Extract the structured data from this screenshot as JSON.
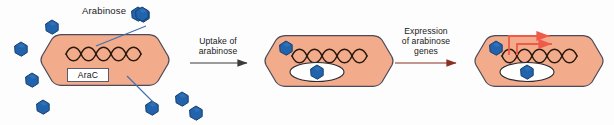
{
  "figure": {
    "type": "diagram",
    "background_color": "#fdfdfd"
  },
  "legend": {
    "arabinose_label": "Arabinose"
  },
  "steps": [
    {
      "id": "uptake",
      "line1": "Uptake of",
      "line2": "arabinose",
      "arrow_color": "#3a3a3a"
    },
    {
      "id": "expression",
      "line1": "Expression",
      "line2": "of arabinose",
      "line3": "genes",
      "arrow_color": "#8a2f22"
    }
  ],
  "cells": [
    {
      "id": "cell-1",
      "state": "AraC bound to DNA, arabinose outside",
      "arac_label": "AraC",
      "has_dna": true,
      "has_arac_box": true,
      "has_arac_protein": false,
      "internal_arabinose": 0,
      "transcription_arrows": 0
    },
    {
      "id": "cell-2",
      "state": "Arabinose entered cell, bound to AraC protein",
      "arac_label": "",
      "has_dna": true,
      "has_arac_box": false,
      "has_arac_protein": true,
      "internal_arabinose": 2,
      "transcription_arrows": 0
    },
    {
      "id": "cell-3",
      "state": "Arabinose genes transcribed",
      "arac_label": "",
      "has_dna": true,
      "has_arac_box": false,
      "has_arac_protein": true,
      "internal_arabinose": 2,
      "transcription_arrows": 2
    }
  ],
  "colors": {
    "cell_fill": "#f2ab8b",
    "cell_stroke": "#4a4a5a",
    "arabinose_fill": "#2163ac",
    "arabinose_stroke": "#17406f",
    "dna_stroke": "#2a1a0e",
    "transcription_arrow": "#ef5a4a",
    "leader_line": "#3f6fae",
    "protein_fill": "#ffffff",
    "protein_stroke": "#2a2a33",
    "text": "#1a1a1a"
  },
  "counts": {
    "external_arabinose_molecules": 9,
    "cell_count": 3,
    "step_arrow_count": 2
  }
}
